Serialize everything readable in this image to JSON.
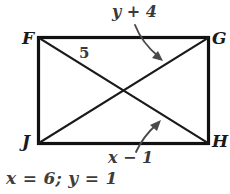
{
  "figure": {
    "name": "rectangle-with-diagonals",
    "shape": "rectangle",
    "vertices": [
      {
        "id": "F",
        "label": "F",
        "position": "top-left"
      },
      {
        "id": "G",
        "label": "G",
        "position": "top-right"
      },
      {
        "id": "H",
        "label": "H",
        "position": "bottom-right"
      },
      {
        "id": "J",
        "label": "J",
        "position": "bottom-left"
      }
    ],
    "diagonals": [
      {
        "id": "FH",
        "from": "F",
        "to": "H"
      },
      {
        "id": "JG",
        "from": "J",
        "to": "G"
      }
    ],
    "labels": {
      "segment_five": "5",
      "top_expression": "y + 4",
      "bottom_expression": "x − 1"
    },
    "annotations": [
      {
        "id": "top-arrow",
        "label": "y + 4",
        "points_to": "FH"
      },
      {
        "id": "bottom-arrow",
        "label": "x − 1",
        "points_to": "JG"
      }
    ],
    "answer": "x = 6; y = 1",
    "colors": {
      "background": "#ffffff",
      "outline": "#111111",
      "diagonal": "#1a1a1a",
      "text": "#2b2b2b",
      "arrow": "#4a4a4a"
    }
  }
}
